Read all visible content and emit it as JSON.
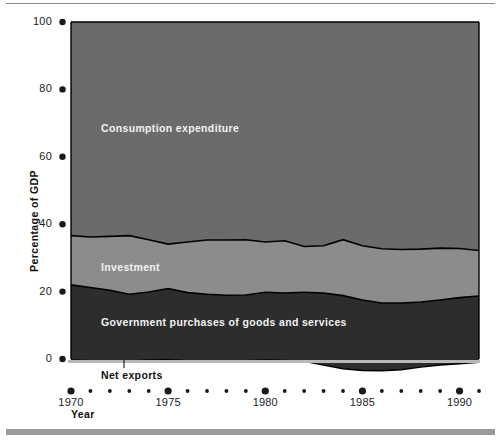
{
  "figure": {
    "background_color": "#ffffff",
    "top_rule_color": "#8e8e8e",
    "bottom_bar_color": "#9a9a9a"
  },
  "axes": {
    "y_axis_title": "Percentage of  GDP",
    "x_axis_title": "Year",
    "y_ticks": [
      "0",
      "20",
      "40",
      "60",
      "80",
      "100"
    ],
    "x_ticks_major": [
      "1970",
      "1975",
      "1980",
      "1985",
      "1990"
    ],
    "tick_marker": "filled-dot"
  },
  "series_labels": {
    "consumption": "Consumption expenditure",
    "investment": "Investment",
    "government": "Government purchases of goods and services",
    "net_exports": "Net exports"
  },
  "colors": {
    "consumption": "#6b6b6b",
    "investment": "#8c8c8c",
    "government": "#2d2d2d",
    "net_exports": "#2d2d2d",
    "outline": "#000000",
    "zero_line": "#b9b9b9",
    "tick_dot": "#1a1a1a"
  },
  "chart_data": {
    "type": "area",
    "stacked": true,
    "title": "",
    "subtitle": "",
    "xlabel": "Year",
    "ylabel": "Percentage of  GDP",
    "ylim": [
      -6,
      100
    ],
    "xlim": [
      1970,
      1991
    ],
    "grid": false,
    "legend": "inline-annotations",
    "x": [
      1970,
      1971,
      1972,
      1973,
      1974,
      1975,
      1976,
      1977,
      1978,
      1979,
      1980,
      1981,
      1982,
      1983,
      1984,
      1985,
      1986,
      1987,
      1988,
      1989,
      1990,
      1991
    ],
    "series": [
      {
        "name": "Government purchases of goods and services",
        "color": "#2d2d2d",
        "values": [
          22.0,
          21.2,
          20.4,
          19.2,
          19.9,
          20.9,
          19.7,
          19.2,
          18.9,
          19.0,
          19.8,
          19.6,
          19.8,
          19.6,
          18.8,
          17.5,
          16.6,
          16.6,
          16.9,
          17.5,
          18.2,
          18.7
        ]
      },
      {
        "name": "Investment",
        "color": "#8c8c8c",
        "values": [
          14.6,
          15.0,
          16.0,
          17.4,
          15.5,
          13.2,
          15.0,
          16.1,
          16.4,
          16.4,
          14.9,
          15.5,
          13.6,
          14.0,
          16.6,
          16.1,
          16.1,
          15.9,
          15.7,
          15.4,
          14.6,
          13.5
        ]
      },
      {
        "name": "Consumption expenditure",
        "color": "#6b6b6b",
        "values": [
          63.4,
          63.8,
          63.6,
          63.4,
          64.6,
          65.9,
          65.3,
          64.7,
          64.7,
          64.6,
          65.3,
          64.9,
          66.6,
          66.4,
          64.6,
          66.4,
          67.3,
          67.5,
          67.4,
          67.1,
          67.2,
          67.8
        ]
      },
      {
        "name": "Net exports",
        "color": "#2d2d2d",
        "values": [
          -0.3,
          -0.5,
          -0.9,
          -0.6,
          -0.3,
          -0.2,
          -0.5,
          -1.0,
          -0.8,
          -0.5,
          -0.3,
          -0.4,
          -0.7,
          -1.8,
          -2.9,
          -3.4,
          -3.5,
          -3.2,
          -2.4,
          -1.8,
          -1.4,
          -1.0
        ]
      }
    ]
  }
}
